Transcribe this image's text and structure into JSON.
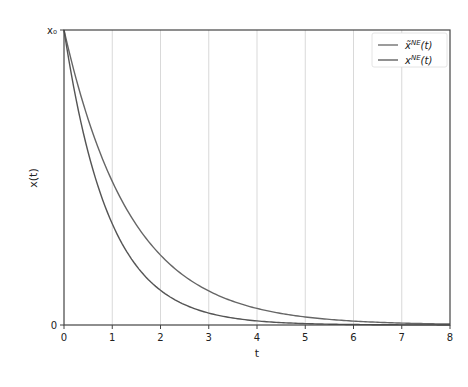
{
  "chart_data": {
    "type": "line",
    "title": "",
    "xlabel": "t",
    "ylabel": "x(t)",
    "xlim": [
      0,
      8
    ],
    "ylim": [
      0,
      1
    ],
    "x_ticks": [
      "0",
      "1",
      "2",
      "3",
      "4",
      "5",
      "6",
      "7",
      "8"
    ],
    "y_ticks": [
      {
        "value": 0,
        "label": "0"
      },
      {
        "value": 1,
        "label": "x₀"
      }
    ],
    "grid": {
      "vertical": true,
      "horizontal": false
    },
    "legend_position": "upper right",
    "x": [
      0,
      1,
      2,
      3,
      4,
      5,
      6,
      7,
      8
    ],
    "series": [
      {
        "name": "x̃^NE(t)",
        "legend_main": "x̃",
        "legend_sup": "NE",
        "legend_arg": "(t)",
        "decay_rate": 0.72,
        "values": [
          1.0,
          0.487,
          0.237,
          0.115,
          0.056,
          0.027,
          0.013,
          0.006,
          0.003
        ],
        "color": "#666666"
      },
      {
        "name": "x^NE(t)",
        "legend_main": "x",
        "legend_sup": "NE",
        "legend_arg": "(t)",
        "decay_rate": 1.07,
        "values": [
          1.0,
          0.343,
          0.118,
          0.04,
          0.014,
          0.005,
          0.002,
          0.001,
          0.0
        ],
        "color": "#555555"
      }
    ]
  }
}
